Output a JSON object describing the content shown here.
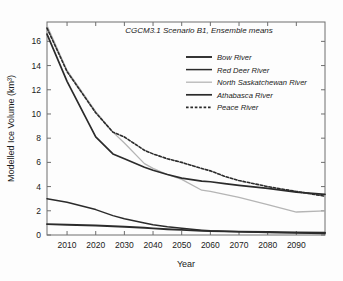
{
  "figure": {
    "name": "modelled-ice-volume-line-chart",
    "background_color": "#fdfdfd"
  },
  "chart_data": {
    "type": "line",
    "title": "CGCM3.1 Scenario B1, Ensemble means",
    "xlabel": "Year",
    "ylabel": "Modelled Ice Volume (km³)",
    "xlim": [
      2003,
      2100
    ],
    "ylim": [
      0,
      17.6
    ],
    "xticks": [
      2010,
      2020,
      2030,
      2040,
      2050,
      2060,
      2070,
      2080,
      2090
    ],
    "xtick_labels": [
      "2010",
      "2020",
      "2030",
      "2040",
      "2050",
      "2060",
      "2070",
      "2080",
      "2090"
    ],
    "yticks": [
      0,
      2,
      4,
      6,
      8,
      10,
      12,
      14,
      16
    ],
    "ytick_labels": [
      "0",
      "2",
      "4",
      "6",
      "8",
      "10",
      "12",
      "14",
      "16"
    ],
    "grid": false,
    "legend_position": "upper right",
    "x": [
      2003,
      2010,
      2020,
      2026,
      2030,
      2037,
      2040,
      2045,
      2050,
      2057,
      2060,
      2065,
      2070,
      2080,
      2090,
      2100
    ],
    "series": [
      {
        "name": "Bow River",
        "label": "Bow River",
        "color": "#2b2b2b",
        "width": 1.9,
        "dash": "solid",
        "values": [
          0.9,
          0.85,
          0.78,
          0.72,
          0.68,
          0.6,
          0.55,
          0.48,
          0.42,
          0.34,
          0.32,
          0.3,
          0.28,
          0.25,
          0.22,
          0.2
        ]
      },
      {
        "name": "Red Deer River",
        "label": "Red Deer River",
        "color": "#2b2b2b",
        "width": 1.5,
        "dash": "solid",
        "values": [
          3.0,
          2.7,
          2.1,
          1.6,
          1.35,
          1.0,
          0.85,
          0.68,
          0.55,
          0.4,
          0.35,
          0.3,
          0.26,
          0.2,
          0.16,
          0.12
        ]
      },
      {
        "name": "North Saskatchewan River",
        "label": "North Saskatchewan River",
        "color": "#b5b5b5",
        "width": 1.3,
        "dash": "solid",
        "values": [
          17.3,
          13.6,
          10.2,
          8.5,
          7.6,
          5.9,
          5.5,
          5.0,
          4.6,
          3.7,
          3.6,
          3.35,
          3.1,
          2.5,
          1.9,
          2.0
        ]
      },
      {
        "name": "Athabasca River",
        "label": "Athabasca River",
        "color": "#2b2b2b",
        "width": 1.7,
        "dash": "solid",
        "values": [
          16.6,
          12.7,
          8.1,
          6.7,
          6.3,
          5.6,
          5.35,
          5.0,
          4.7,
          4.45,
          4.4,
          4.25,
          4.1,
          3.85,
          3.55,
          3.35
        ]
      },
      {
        "name": "Peace River",
        "label": "Peace River",
        "color": "#2b2b2b",
        "width": 1.6,
        "dash": "dashed",
        "values": [
          17.1,
          13.5,
          10.1,
          8.5,
          8.1,
          7.0,
          6.7,
          6.3,
          6.0,
          5.5,
          5.3,
          4.85,
          4.5,
          4.0,
          3.6,
          3.2
        ]
      }
    ]
  },
  "legend": {
    "entries": [
      {
        "label": "Bow River"
      },
      {
        "label": "Red Deer River"
      },
      {
        "label": "North Saskatchewan River"
      },
      {
        "label": "Athabasca River"
      },
      {
        "label": "Peace River"
      }
    ]
  }
}
